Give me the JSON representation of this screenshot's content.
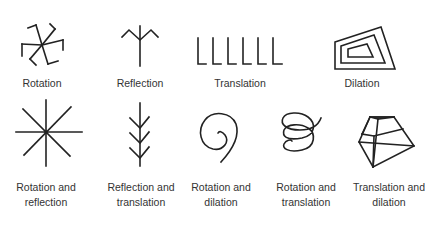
{
  "diagram": {
    "stroke_color": "#222222",
    "label_color": "#333333",
    "background": "#ffffff",
    "row1": [
      {
        "id": "rotation",
        "icon": "pinwheel-icon",
        "label": "Rotation"
      },
      {
        "id": "reflection",
        "icon": "mirrored-branch-icon",
        "label": "Reflection"
      },
      {
        "id": "translation",
        "icon": "repeated-l-icon",
        "label": "Translation"
      },
      {
        "id": "dilation",
        "icon": "nested-trapezoids-icon",
        "label": "Dilation"
      }
    ],
    "row2": [
      {
        "id": "rotation-reflection",
        "icon": "eight-point-star-icon",
        "line1": "Rotation and",
        "line2": "reflection"
      },
      {
        "id": "reflection-translation",
        "icon": "herringbone-icon",
        "line1": "Reflection and",
        "line2": "translation"
      },
      {
        "id": "rotation-dilation",
        "icon": "spiral-icon",
        "line1": "Rotation and",
        "line2": "dilation"
      },
      {
        "id": "rotation-translation",
        "icon": "helix-icon",
        "line1": "Rotation and",
        "line2": "translation"
      },
      {
        "id": "translation-dilation",
        "icon": "stacked-trapezoids-icon",
        "line1": "Translation and",
        "line2": "dilation"
      }
    ]
  }
}
